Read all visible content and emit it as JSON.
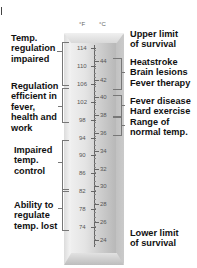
{
  "units": {
    "fahrenheit": "°F",
    "celsius": "°C"
  },
  "scale": {
    "fahrenheit": [
      {
        "label": "114",
        "y": 45
      },
      {
        "label": "110",
        "y": 63
      },
      {
        "label": "106",
        "y": 81
      },
      {
        "label": "102",
        "y": 99
      },
      {
        "label": "98",
        "y": 117
      },
      {
        "label": "94",
        "y": 135
      },
      {
        "label": "90",
        "y": 152
      },
      {
        "label": "86",
        "y": 170
      },
      {
        "label": "82",
        "y": 188
      },
      {
        "label": "78",
        "y": 206
      },
      {
        "label": "74",
        "y": 224
      }
    ],
    "celsius": [
      {
        "label": "44",
        "y": 58
      },
      {
        "label": "42",
        "y": 77
      },
      {
        "label": "40",
        "y": 94
      },
      {
        "label": "38",
        "y": 112
      },
      {
        "label": "36",
        "y": 130
      },
      {
        "label": "34",
        "y": 148
      },
      {
        "label": "32",
        "y": 166
      },
      {
        "label": "30",
        "y": 183
      },
      {
        "label": "28",
        "y": 201
      },
      {
        "label": "26",
        "y": 219
      },
      {
        "label": "24",
        "y": 237
      }
    ]
  },
  "left_labels": {
    "temp_regulation_impaired": "Temp.\nregulation\nimpaired",
    "regulation_efficient": "Regulation\nefficient in\nfever,\nhealth and\nwork",
    "impaired_temp_control": "Impaired\ntemp.\ncontrol",
    "ability_lost": "Ability to\nregulate\ntemp. lost"
  },
  "right_labels": {
    "upper_limit": "Upper limit\nof survival",
    "heatstroke_group": "Heatstroke\nBrain lesions\nFever therapy",
    "fever_group": "Fever disease\nHard exercise\nRange of\nnormal temp.",
    "lower_limit": "Lower limit\nof survival"
  }
}
